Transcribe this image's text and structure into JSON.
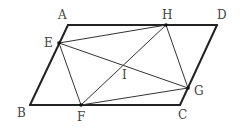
{
  "diagram": {
    "colors": {
      "stroke": "#222222",
      "thin_stroke": "#333333",
      "label": "#444444",
      "background": "#ffffff"
    },
    "points": {
      "A": {
        "label": "A",
        "x": 68,
        "y": 25
      },
      "B": {
        "label": "B",
        "x": 30,
        "y": 105
      },
      "C": {
        "label": "C",
        "x": 180,
        "y": 105
      },
      "D": {
        "label": "D",
        "x": 217,
        "y": 25
      },
      "E": {
        "label": "E",
        "x": 59,
        "y": 43
      },
      "F": {
        "label": "F",
        "x": 81,
        "y": 105
      },
      "G": {
        "label": "G",
        "x": 188,
        "y": 88
      },
      "H": {
        "label": "H",
        "x": 166,
        "y": 25
      },
      "I": {
        "label": "I",
        "x": 124,
        "y": 65
      }
    },
    "outer_edges": [
      [
        "A",
        "D"
      ],
      [
        "D",
        "C"
      ],
      [
        "C",
        "B"
      ],
      [
        "B",
        "A"
      ]
    ],
    "inner_segments": [
      [
        "E",
        "H"
      ],
      [
        "H",
        "G"
      ],
      [
        "G",
        "F"
      ],
      [
        "F",
        "E"
      ],
      [
        "E",
        "G"
      ],
      [
        "H",
        "F"
      ]
    ]
  }
}
